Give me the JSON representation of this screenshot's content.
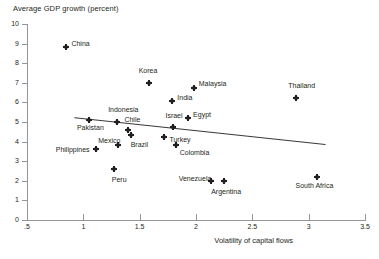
{
  "chart_data": {
    "type": "scatter",
    "title": "Average GDP growth (percent)",
    "ylabel": "Average GDP growth (percent)",
    "xlabel": "Volatility of capital flows",
    "xlim": [
      0.5,
      3.5
    ],
    "ylim": [
      0,
      10
    ],
    "grid": false,
    "legend": "none",
    "x_ticks": [
      0.5,
      1,
      1.5,
      2,
      2.5,
      3,
      3.5
    ],
    "x_tick_labels": [
      ".5",
      "1",
      "1.5",
      "2",
      "2.5",
      "3",
      "3.5"
    ],
    "y_ticks": [
      0,
      1,
      2,
      3,
      4,
      5,
      6,
      7,
      8,
      9,
      10
    ],
    "y_tick_labels": [
      "0",
      "1",
      "2",
      "3",
      "4",
      "5",
      "6",
      "7",
      "8",
      "9",
      "10"
    ],
    "points": [
      {
        "label": "China",
        "x": 0.85,
        "y": 8.85,
        "label_dx": 5,
        "label_dy": -3
      },
      {
        "label": "Korea",
        "x": 1.58,
        "y": 7.0,
        "label_dx": -10,
        "label_dy": -12
      },
      {
        "label": "Malaysia",
        "x": 1.98,
        "y": 6.75,
        "label_dx": 5,
        "label_dy": -4
      },
      {
        "label": "Thailand",
        "x": 2.89,
        "y": 6.25,
        "label_dx": -8,
        "label_dy": -12
      },
      {
        "label": "India",
        "x": 1.79,
        "y": 6.05,
        "label_dx": 5,
        "label_dy": -3
      },
      {
        "label": "Egypt",
        "x": 1.93,
        "y": 5.2,
        "label_dx": 5,
        "label_dy": -3
      },
      {
        "label": "Indonesia",
        "x": 1.3,
        "y": 5.02,
        "label_dx": -9,
        "label_dy": -12
      },
      {
        "label": "Pakistan",
        "x": 1.05,
        "y": 5.08,
        "label_dx": -12,
        "label_dy": 8
      },
      {
        "label": "Israel",
        "x": 1.8,
        "y": 4.73,
        "label_dx": -8,
        "label_dy": -11
      },
      {
        "label": "Chile",
        "x": 1.4,
        "y": 4.6,
        "label_dx": -4,
        "label_dy": -10
      },
      {
        "label": "Turkey",
        "x": 1.72,
        "y": 4.22,
        "label_dx": 5,
        "label_dy": 3
      },
      {
        "label": "Brazil",
        "x": 1.42,
        "y": 4.32,
        "label_dx": 0,
        "label_dy": 10
      },
      {
        "label": "Mexico",
        "x": 1.31,
        "y": 3.82,
        "label_dx": -20,
        "label_dy": -4
      },
      {
        "label": "Colombia",
        "x": 1.82,
        "y": 3.85,
        "label_dx": 4,
        "label_dy": 8
      },
      {
        "label": "Philippines",
        "x": 1.11,
        "y": 3.62,
        "label_dx": -40,
        "label_dy": 1
      },
      {
        "label": "Peru",
        "x": 1.27,
        "y": 2.6,
        "label_dx": -2,
        "label_dy": 11
      },
      {
        "label": "South Africa",
        "x": 3.07,
        "y": 2.2,
        "label_dx": -21,
        "label_dy": 9
      },
      {
        "label": "Venezuela",
        "x": 2.13,
        "y": 1.97,
        "label_dx": -32,
        "label_dy": -2
      },
      {
        "label": "Argentina",
        "x": 2.25,
        "y": 1.97,
        "label_dx": -13,
        "label_dy": 11
      }
    ],
    "trend_line": {
      "x_start": 0.92,
      "y_start": 5.22,
      "x_end": 3.15,
      "y_end": 3.85,
      "color": "#231f20"
    }
  },
  "axis_title": "Volatility of capital flows",
  "plot_title": "Average GDP growth (percent)"
}
